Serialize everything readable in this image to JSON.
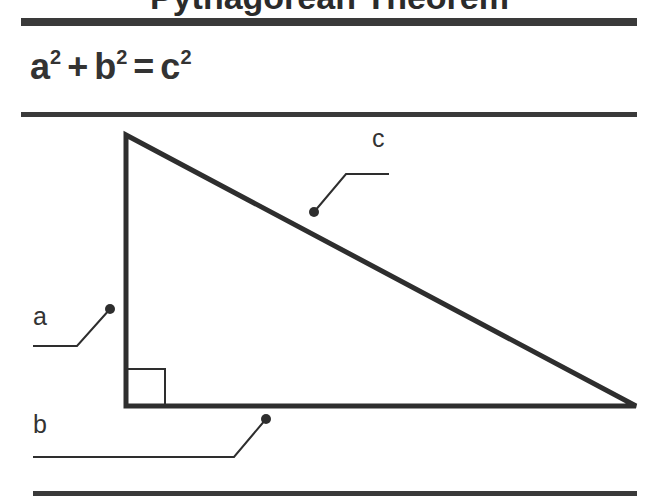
{
  "title": "Pythagorean Theorem",
  "formula": {
    "a": "a",
    "a_exp": "2",
    "plus": "+",
    "b": "b",
    "b_exp": "2",
    "equals": "=",
    "c": "c",
    "c_exp": "2"
  },
  "diagram": {
    "type": "right-triangle",
    "labels": {
      "hypotenuse": "c",
      "vertical_leg": "a",
      "horizontal_leg": "b"
    },
    "right_angle_marker": true,
    "colors": {
      "stroke": "#2e2e2e",
      "rule": "#3a3a3a"
    }
  }
}
